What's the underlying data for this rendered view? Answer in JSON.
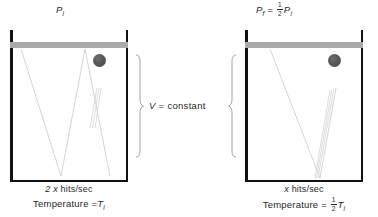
{
  "diagram": {
    "type": "physics-illustration",
    "left_panel": {
      "title_symbol": "P",
      "title_subscript": "i",
      "piston_label": "piston",
      "hits_prefix": "2",
      "hits_variable": "x",
      "hits_unit": "hits/sec",
      "temperature_label": "Temperature",
      "temperature_equals": "=",
      "temperature_symbol": "T",
      "temperature_subscript": "i",
      "bounce_count": 2
    },
    "right_panel": {
      "title_symbol": "P",
      "title_subscript": "f",
      "title_equals": "=",
      "title_fraction_numerator": "1",
      "title_fraction_denominator": "2",
      "title_rhs_symbol": "P",
      "title_rhs_subscript": "i",
      "hits_variable": "x",
      "hits_unit": "hits/sec",
      "temperature_label": "Temperature",
      "temperature_equals": "=",
      "temperature_fraction_numerator": "1",
      "temperature_fraction_denominator": "2",
      "temperature_symbol": "T",
      "temperature_subscript": "i",
      "bounce_count": 1
    },
    "center": {
      "volume_symbol": "V",
      "equals": "=",
      "volume_value": "constant"
    },
    "colors": {
      "wall": "#111111",
      "piston": "#aaaaaa",
      "particle": "#555555",
      "trajectory": "#cccccc",
      "text": "#1f1f1f",
      "background": "#ffffff"
    }
  }
}
